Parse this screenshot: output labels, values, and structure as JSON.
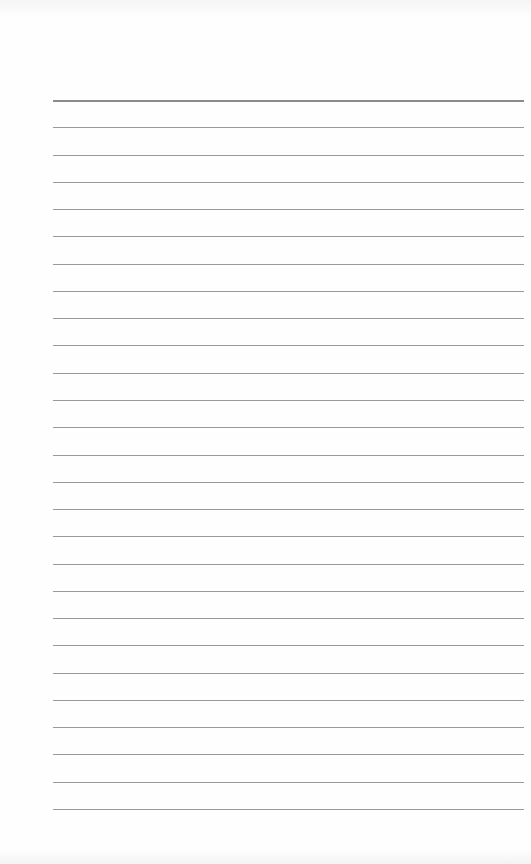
{
  "document": {
    "type": "lined-paper",
    "ruled_lines": 27,
    "header_line_count": 1,
    "colors": {
      "paper": "#fefefe",
      "line": "#9a9a9a",
      "header_line": "#8a8a8a"
    }
  }
}
